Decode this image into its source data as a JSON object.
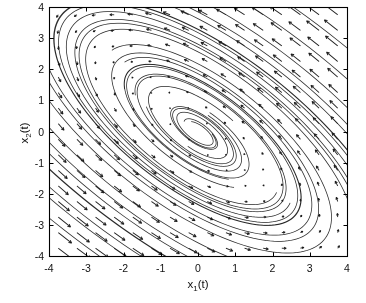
{
  "figure": {
    "background": "#ffffff",
    "frame_color": "#000000"
  },
  "labels": {
    "x_base": "x",
    "x_sub": "1",
    "x_paren": "(t)",
    "y_base": "x",
    "y_sub": "2",
    "y_paren": "(t)"
  },
  "chart_data": {
    "type": "line",
    "subtype": "phase-portrait-with-vector-field",
    "title": "",
    "xlabel": "x_1(t)",
    "ylabel": "x_2(t)",
    "xlim": [
      -4,
      4
    ],
    "ylim": [
      -4,
      4
    ],
    "x_tick_values": [
      -4,
      -3,
      -2,
      -1,
      0,
      1,
      2,
      3,
      4
    ],
    "x_tick_labels": [
      "-4",
      "-3",
      "-2",
      "-1",
      "0",
      "1",
      "2",
      "3",
      "4"
    ],
    "y_tick_values": [
      4,
      3,
      2,
      1,
      0,
      -1,
      -2,
      -3,
      -4
    ],
    "y_tick_labels": [
      "4",
      "3",
      "2",
      "1",
      "0",
      "-1",
      "-2",
      "-3",
      "-4"
    ],
    "grid": false,
    "legend": null,
    "equilibrium": [
      0,
      0
    ],
    "behavior": "stable focus at origin; counterclockwise inward spirals; orbits are ellipses elongated along the NW-SE diagonal; curves clipped at axes box",
    "system": {
      "A": [
        [
          -1.0,
          -1.3
        ],
        [
          1.3,
          0.8
        ]
      ]
    },
    "vector_field": {
      "grid_min": -3.75,
      "grid_max": 3.75,
      "grid_n": 16,
      "arrow_scale": 0.045,
      "head_len_px": 3.3,
      "head_angle_rad": 0.46,
      "color": "#1b1b1b",
      "line_width": 0.9
    },
    "trajectories": {
      "outer": {
        "angles_deg": [
          95,
          170,
          245,
          320,
          35
        ],
        "radii": [
          5.8,
          6.8
        ],
        "t_max": 15
      },
      "inner": [
        {
          "r": 1.6,
          "angle_deg": 150,
          "t_max": 13
        },
        {
          "r": 1.0,
          "angle_deg": 20,
          "t_max": 13
        },
        {
          "r": 0.55,
          "angle_deg": 240,
          "t_max": 11
        }
      ],
      "dt": 0.04,
      "color": "#272727",
      "line_width": 0.75
    },
    "frame": {
      "tick_len_px": 4,
      "line_width": 1.1
    },
    "tick_font_px": 10.5,
    "label_font_px": 11.5
  }
}
